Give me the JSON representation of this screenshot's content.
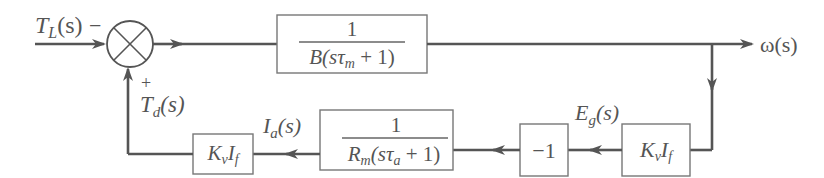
{
  "diagram": {
    "type": "block-diagram",
    "signals": {
      "load_torque": {
        "name": "T",
        "sub": "L",
        "arg": "(s)",
        "sign": "−"
      },
      "disturbance": {
        "name": "T",
        "sub": "d",
        "arg": "(s)",
        "sign": "+"
      },
      "output": {
        "label": "ω(s)"
      },
      "armature_current": {
        "name": "I",
        "sub": "a",
        "arg": "(s)"
      },
      "back_emf": {
        "name": "E",
        "sub": "g",
        "arg": "(s)"
      }
    },
    "blocks": {
      "mechanical": {
        "numerator": "1",
        "den_pre": "B(s",
        "den_tau": "τ",
        "den_sub": "m",
        "den_post": " + 1)"
      },
      "electrical": {
        "numerator": "1",
        "den_pre": "R",
        "den_pre_sub": "m",
        "den_mid": "(s",
        "den_tau": "τ",
        "den_sub": "a",
        "den_post": " + 1)"
      },
      "negate": {
        "label": "−1"
      },
      "emf_gain": {
        "k": "K",
        "k_sub": "v",
        "i": "I",
        "i_sub": "f"
      },
      "torque_gain": {
        "k": "K",
        "k_sub": "v",
        "i": "I",
        "i_sub": "f"
      }
    },
    "summing_junction": {
      "inputs": [
        "T_L(s) −",
        "T_d(s) +"
      ]
    }
  }
}
